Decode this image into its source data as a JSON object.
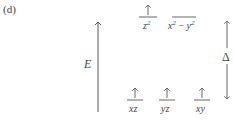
{
  "panel": {
    "label": "(d)"
  },
  "axis": {
    "label": "E",
    "color": "#666666"
  },
  "gap": {
    "label": "Δ"
  },
  "levels": {
    "upper": [
      {
        "name": "z2",
        "label_base": "z",
        "label_sup": "2",
        "electron": "up"
      },
      {
        "name": "x2-y2",
        "label_base": "x",
        "label_sup": "2",
        "label_mid": " − ",
        "label_base2": "y",
        "label_sup2": "2",
        "electron": "none"
      }
    ],
    "lower": [
      {
        "name": "xz",
        "label": "xz",
        "electron": "up"
      },
      {
        "name": "yz",
        "label": "yz",
        "electron": "up"
      },
      {
        "name": "xy",
        "label": "xy",
        "electron": "up"
      }
    ]
  },
  "colors": {
    "line": "#555555",
    "text": "#444444",
    "background": "#ffffff"
  }
}
